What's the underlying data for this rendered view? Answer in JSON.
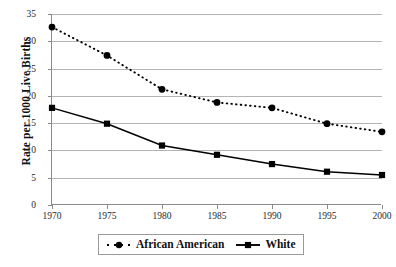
{
  "chart_data": {
    "type": "line",
    "title": "",
    "xlabel": "",
    "ylabel": "Rate per 1000 Live Births",
    "categories": [
      "1970",
      "1975",
      "1980",
      "1985",
      "1990",
      "1995",
      "2000"
    ],
    "x": [
      1970,
      1975,
      1980,
      1985,
      1990,
      1995,
      2000
    ],
    "xlim": [
      1970,
      2000
    ],
    "ylim": [
      0,
      35
    ],
    "yticks": [
      0,
      5,
      10,
      15,
      20,
      25,
      30,
      35
    ],
    "ytick_labels": [
      "0",
      "5",
      "10",
      "15",
      "20",
      "25",
      "30",
      "35"
    ],
    "grid": true,
    "legend_position": "bottom",
    "series": [
      {
        "name": "African American",
        "values": [
          32.6,
          27.4,
          21.2,
          18.8,
          17.8,
          14.9,
          13.4
        ],
        "color": "#000000",
        "line_style": "dotted",
        "marker": "circle"
      },
      {
        "name": "White",
        "values": [
          17.8,
          14.9,
          10.9,
          9.2,
          7.5,
          6.1,
          5.5
        ],
        "color": "#000000",
        "line_style": "solid",
        "marker": "square"
      }
    ]
  },
  "axes": {
    "grid_color": "#b4b4b4",
    "axis_color": "#8a8a8a"
  },
  "legend": {
    "items": [
      {
        "label": "African American",
        "marker": "circle",
        "line_style": "dotted"
      },
      {
        "label": "White",
        "marker": "square",
        "line_style": "solid"
      }
    ]
  }
}
